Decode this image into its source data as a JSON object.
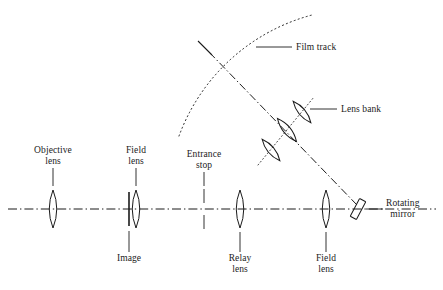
{
  "figure": {
    "kind": "optical-ray-diagram",
    "background_color": "#ffffff",
    "ink_color": "#1b1b1b"
  },
  "axis": {
    "name": "optical-axis",
    "style": "dash-dot",
    "y": 209,
    "x_start": 8,
    "x_end": 436
  },
  "components": [
    {
      "id": "objective-lens",
      "label": "Objective\nlens",
      "label_line1": "Objective",
      "label_line2": "lens",
      "label_position": "above",
      "x": 53,
      "y": 209,
      "half_height": 19,
      "half_width": 7
    },
    {
      "id": "field-lens-1",
      "label_line1": "Field",
      "label_line2": "lens",
      "label_position": "above",
      "x": 136,
      "y": 209,
      "half_height": 19,
      "half_width": 7
    },
    {
      "id": "image-plane",
      "label_line1": "Image",
      "label_line2": "",
      "label_position": "below",
      "x": 129,
      "y": 209,
      "half_height": 17
    },
    {
      "id": "entrance-stop",
      "label_line1": "Entrance",
      "label_line2": "stop",
      "label_position": "above",
      "x": 204,
      "y": 209,
      "gap_half": 6,
      "arm": 16
    },
    {
      "id": "relay-lens",
      "label_line1": "Relay",
      "label_line2": "lens",
      "label_position": "below",
      "x": 240,
      "y": 209,
      "half_height": 19,
      "half_width": 7
    },
    {
      "id": "field-lens-2",
      "label_line1": "Field",
      "label_line2": "lens",
      "label_position": "below",
      "x": 326,
      "y": 209,
      "half_height": 19,
      "half_width": 7
    },
    {
      "id": "rotating-mirror",
      "label_line1": "Rotating",
      "label_line2": "mirror",
      "label_position": "right",
      "x": 358,
      "y": 209,
      "tilt_deg": 45,
      "length": 19,
      "width": 7
    },
    {
      "id": "lens-bank",
      "label_line1": "Lens bank",
      "label_line2": "",
      "label_position": "right",
      "x": 287,
      "y": 128,
      "element_count": 3,
      "tilt_deg": -38
    },
    {
      "id": "film-track",
      "label_line1": "Film track",
      "label_line2": "",
      "label_position": "right",
      "style": "dotted-arc",
      "arc_start": [
        179,
        136
      ],
      "arc_end": [
        312,
        15
      ]
    }
  ],
  "labels": {
    "objective_lens_l1": "Objective",
    "objective_lens_l2": "lens",
    "field_lens_top_l1": "Field",
    "field_lens_top_l2": "lens",
    "entrance_stop_l1": "Entrance",
    "entrance_stop_l2": "stop",
    "image": "Image",
    "relay_lens_l1": "Relay",
    "relay_lens_l2": "lens",
    "field_lens_bottom_l1": "Field",
    "field_lens_bottom_l2": "lens",
    "rotating_mirror_l1": "Rotating",
    "rotating_mirror_l2": "mirror",
    "film_track": "Film track",
    "lens_bank": "Lens bank"
  },
  "colors": {
    "ink": "#1b1b1b",
    "background": "#ffffff"
  }
}
